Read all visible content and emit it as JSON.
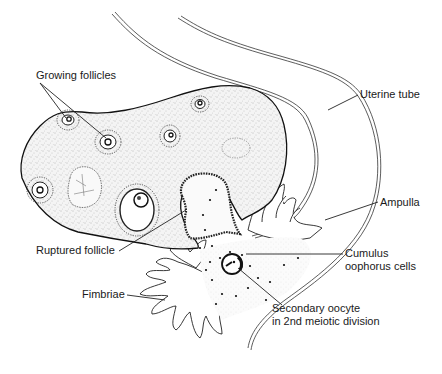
{
  "diagram": {
    "type": "anatomical-illustration",
    "labels": [
      {
        "id": "growing_follicles",
        "text": "Growing follicles",
        "x": 36,
        "y": 67
      },
      {
        "id": "uterine_tube",
        "text": "Uterine tube",
        "x": 360,
        "y": 88
      },
      {
        "id": "ampulla",
        "text": "Ampulla",
        "x": 380,
        "y": 196
      },
      {
        "id": "cumulus",
        "text": "Cumulus\noophorus cells",
        "x": 345,
        "y": 247
      },
      {
        "id": "ruptured_follicle",
        "text": "Ruptured follicle",
        "x": 36,
        "y": 244
      },
      {
        "id": "fimbriae",
        "text": "Fimbriae",
        "x": 82,
        "y": 288
      },
      {
        "id": "secondary_oocyte",
        "text": "Secondary oocyte\nin 2nd meiotic division",
        "x": 272,
        "y": 302
      }
    ],
    "colors": {
      "background": "#ffffff",
      "ink": "#1c1c1c"
    }
  }
}
